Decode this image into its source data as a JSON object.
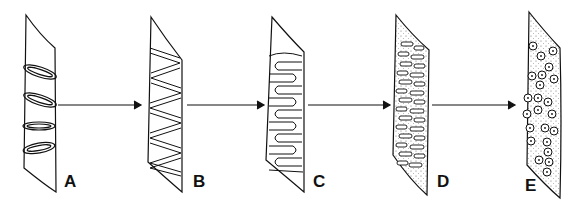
{
  "diagram": {
    "stages": [
      {
        "label": "A",
        "pattern": "oval-rings"
      },
      {
        "label": "B",
        "pattern": "zigzag-bands"
      },
      {
        "label": "C",
        "pattern": "meandering-folds"
      },
      {
        "label": "D",
        "pattern": "dense-oblong-segments-stippled"
      },
      {
        "label": "E",
        "pattern": "dotted-circles-stippled"
      }
    ],
    "arrows": [
      {
        "from": "A",
        "to": "B"
      },
      {
        "from": "B",
        "to": "C"
      },
      {
        "from": "C",
        "to": "D"
      },
      {
        "from": "D",
        "to": "E"
      }
    ],
    "colors": {
      "ink": "#111111",
      "background": "#ffffff"
    }
  }
}
